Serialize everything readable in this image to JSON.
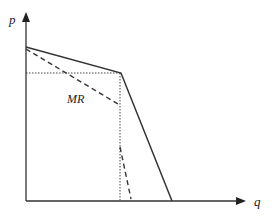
{
  "diagram": {
    "type": "kinked-demand-curve",
    "axes": {
      "y_label": "p",
      "x_label": "q"
    },
    "curves": [
      {
        "name": "demand",
        "style": "solid",
        "points": [
          [
            26,
            47
          ],
          [
            121,
            73
          ],
          [
            172,
            201
          ]
        ]
      },
      {
        "name": "MR",
        "label": "MR",
        "style": "dashed",
        "segments": [
          [
            [
              26,
              49
            ],
            [
              118,
              104
            ]
          ],
          [
            [
              120,
              147
            ],
            [
              131,
              199
            ]
          ]
        ]
      }
    ],
    "guides": {
      "horizontal_dotted_y": 73,
      "vertical_dotted_x": 120
    },
    "colors": {
      "line": "#333333",
      "background": "#ffffff"
    }
  }
}
